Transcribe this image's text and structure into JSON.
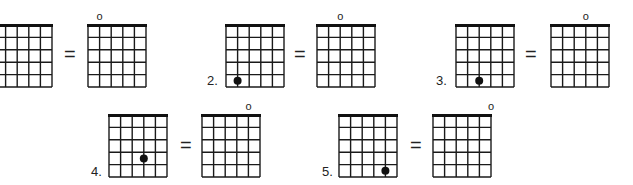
{
  "exercise": {
    "description": "Chord diagram equivalence exercise: each fretted note equals an open string",
    "grid": {
      "strings": 6,
      "frets": 5,
      "cell_w": 11.6,
      "cell_h": 12.4,
      "line_color": "#1a1a1a",
      "nut_color": "#111111"
    },
    "equals_symbol": "=",
    "open_symbol": "o",
    "problems": [
      {
        "number": "",
        "left": {
          "x": -7,
          "y": 24,
          "dot": null
        },
        "equals": {
          "x": 64,
          "y": 44
        },
        "right": {
          "x": 87,
          "y": 24,
          "open_string": 2
        }
      },
      {
        "number": "2.",
        "label_pos": {
          "x": 207,
          "y": 74
        },
        "left": {
          "x": 225,
          "y": 24,
          "dot": {
            "string": 2,
            "fret": 5
          }
        },
        "equals": {
          "x": 294,
          "y": 44
        },
        "right": {
          "x": 316,
          "y": 24,
          "open_string": 3
        }
      },
      {
        "number": "3.",
        "label_pos": {
          "x": 436,
          "y": 74
        },
        "left": {
          "x": 455,
          "y": 24,
          "dot": {
            "string": 3,
            "fret": 5
          }
        },
        "equals": {
          "x": 525,
          "y": 44
        },
        "right": {
          "x": 550,
          "y": 24,
          "open_string": 4
        }
      },
      {
        "number": "4.",
        "label_pos": {
          "x": 91,
          "y": 165
        },
        "left": {
          "x": 108,
          "y": 114,
          "dot": {
            "string": 4,
            "fret": 4
          }
        },
        "equals": {
          "x": 180,
          "y": 135
        },
        "right": {
          "x": 201,
          "y": 114,
          "open_string": 5
        }
      },
      {
        "number": "5.",
        "label_pos": {
          "x": 322,
          "y": 165
        },
        "left": {
          "x": 338,
          "y": 114,
          "dot": {
            "string": 5,
            "fret": 5
          }
        },
        "equals": {
          "x": 410,
          "y": 135
        },
        "right": {
          "x": 432,
          "y": 114,
          "open_string": 6
        }
      }
    ]
  }
}
